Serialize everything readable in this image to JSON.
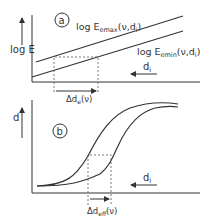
{
  "panel_a": {
    "marker": "a",
    "y_label": "log E",
    "upper_curve_label_main": "log E",
    "upper_curve_label_sub": "emax",
    "upper_curve_label_args": "(ν,d",
    "upper_curve_label_args_sub": "i",
    "upper_curve_label_close": ")",
    "lower_curve_label_main": "log E",
    "lower_curve_label_sub": "emin",
    "lower_curve_label_args": "(ν,d",
    "lower_curve_label_args_sub": "i",
    "lower_curve_label_close": ")",
    "direction_label": "d",
    "direction_label_sub": "i",
    "interval_label_main": "Δd",
    "interval_label_sub": "e",
    "interval_label_args": "(ν)"
  },
  "panel_b": {
    "marker": "b",
    "y_label": "d",
    "direction_label": "d",
    "direction_label_sub": "i",
    "interval_label_main": "Δd",
    "interval_label_sub": "eff",
    "interval_label_args": "(ν)"
  },
  "colors": {
    "line": "#333333",
    "dashed": "#555555",
    "background": "#ffffff"
  }
}
